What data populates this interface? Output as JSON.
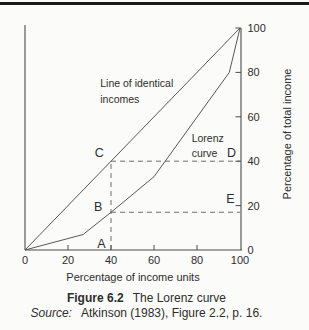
{
  "chart_data": {
    "type": "line",
    "xlabel": "Percentage of income units",
    "ylabel_right": "Percentage of total income",
    "xlim": [
      0,
      100
    ],
    "ylim": [
      0,
      100
    ],
    "x_ticks": [
      0,
      20,
      40,
      60,
      80,
      100
    ],
    "y_ticks": [
      0,
      20,
      40,
      60,
      80,
      100
    ],
    "grid": false,
    "series": [
      {
        "name": "Line of identical incomes",
        "points": [
          [
            0,
            0
          ],
          [
            100,
            100
          ]
        ]
      },
      {
        "name": "Lorenz curve",
        "points": [
          [
            0,
            0
          ],
          [
            27,
            7
          ],
          [
            40,
            17
          ],
          [
            60,
            33
          ],
          [
            95,
            80
          ],
          [
            100,
            100
          ]
        ]
      }
    ],
    "guides": [
      {
        "type": "v",
        "x": 40,
        "y1": 0,
        "y2": 40
      },
      {
        "type": "h",
        "y": 40,
        "x1": 40,
        "x2": 100
      },
      {
        "type": "h",
        "y": 17,
        "x1": 40,
        "x2": 100
      }
    ],
    "point_labels": [
      {
        "label": "A",
        "x": 35.5,
        "y": 2.5
      },
      {
        "label": "B",
        "x": 34,
        "y": 19.5
      },
      {
        "label": "C",
        "x": 34.5,
        "y": 43.5
      },
      {
        "label": "D",
        "x": 96,
        "y": 43.5
      },
      {
        "label": "E",
        "x": 95.5,
        "y": 23
      }
    ],
    "series_labels": [
      {
        "text": "Line of identical",
        "x": 35,
        "y": 73.4
      },
      {
        "text": "incomes",
        "x": 35,
        "y": 66
      },
      {
        "text": "Lorenz",
        "x": 77.5,
        "y": 48.6
      },
      {
        "text": "curve",
        "x": 77.5,
        "y": 42
      }
    ]
  },
  "caption": {
    "figure_label": "Figure 6.2",
    "figure_title": "The Lorenz curve",
    "source_label": "Source:",
    "source_text": "Atkinson (1983), Figure 2.2, p. 16."
  },
  "colors": {
    "line": "#585858",
    "axis": "#4c4c4c",
    "dashed_guide": "#6e6e6e",
    "text": "#2d2d2d",
    "top_rule": "#1b1b1b",
    "background": "#fbfbf9"
  }
}
